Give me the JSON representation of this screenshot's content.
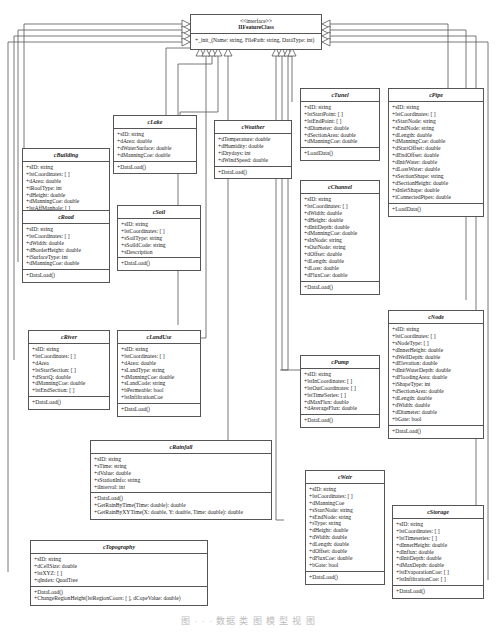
{
  "interface": {
    "stereotype": "<<interface>>",
    "name": "IIFeatureClass",
    "operation": "+_init_(Name: string, FilePath: string, DataType: int)"
  },
  "classes": {
    "building": {
      "name": "cBuilding",
      "attributes": [
        "+sID: string",
        "+lstCoordinates: [ ]",
        "+dArea: double",
        "+iRoofType: int",
        "+dHeight: double",
        "+dManningCoe: double",
        "+lstAffManhole: [ ]"
      ],
      "operations": [
        "+DataLoad()"
      ]
    },
    "lake": {
      "name": "cLake",
      "attributes": [
        "+sID: string",
        "+dArea: double",
        "+dWaterSurface: double",
        "+dManningCoe: double"
      ],
      "operations": [
        "+DataLoad()"
      ]
    },
    "weather": {
      "name": "cWeather",
      "attributes": [
        "+dTemperature: double",
        "+dHumidity: double",
        "+iDrydays: int",
        "+dWindSpeed: double"
      ],
      "operations": [
        "+DataLoad()"
      ]
    },
    "tunel": {
      "name": "cTunel",
      "attributes": [
        "+sID: string",
        "+lstStartPoint: [ ]",
        "+lstEndPoint: [ ]",
        "+dDiameter: double",
        "+dSectionArea: double",
        "+dManningCoe: double"
      ],
      "operations": [
        "+LoadData()"
      ]
    },
    "pipe": {
      "name": "cPipe",
      "attributes": [
        "+sID: string",
        "+lstCoordinates: [ ]",
        "+sStartNode: string",
        "+sEndNode: string",
        "+dLength: double",
        "+dManningCoe: double",
        "+dStartOffset: double",
        "+dEndOffset: double",
        "+dInitWater: double",
        "+dLossWater: double",
        "+sSectionShape: string",
        "+dSectionHeight: double",
        "+sInletShape: double",
        "+iConnectedPipes: double"
      ],
      "operations": [
        "+LoadData()"
      ]
    },
    "road": {
      "name": "cRoad",
      "attributes": [
        "+sID: string",
        "+lstCoordinates: [ ]",
        "+dWidth: double",
        "+dBorderHeight: double",
        "+iSurfaceType: int",
        "+dManningCoe: double"
      ],
      "operations": [
        "+DataLoad()"
      ]
    },
    "soil": {
      "name": "cSoil",
      "attributes": [
        "+sID: string",
        "+lstCoordinates: [ ]",
        "+sSoilType: string",
        "+sSoildCode: string",
        "+sDescription"
      ],
      "operations": [
        "+DataLoad()"
      ]
    },
    "channel": {
      "name": "cChannel",
      "attributes": [
        "+sID: string",
        "+lstCoordinates: [ ]",
        "+dWidth: double",
        "+dHeight: double",
        "+dInitDepth: double",
        "+dManningCoe: double",
        "+sInNode: string",
        "+sOutNode: string",
        "+dOffset: double",
        "+dLength: double",
        "+dLoss: double",
        "+dFluxCoe: double"
      ],
      "operations": [
        "+DataLoad()"
      ]
    },
    "river": {
      "name": "cRiver",
      "attributes": [
        "+sID: string",
        "+lstCoordinates: [ ]",
        "+dArea",
        "+lstStartSection: [ ]",
        "+dStartQ: double",
        "+dManningCoe: double",
        "+lstEndSection: [ ]"
      ],
      "operations": [
        "+DataLoad()"
      ]
    },
    "landuse": {
      "name": "cLandUse",
      "attributes": [
        "+sID: string",
        "+lstCoordinates: [ ]",
        "+dArea: double",
        "+sLandType: string",
        "+dManningCoe: double",
        "+sLandCode: string",
        "+bPermeable: bool",
        "+lstInfiltrationCoe"
      ],
      "operations": [
        "+DataLoad()"
      ]
    },
    "pump": {
      "name": "cPump",
      "attributes": [
        "+sID: string",
        "+lstInCoordinates: [ ]",
        "+lstOutCoordinates: [ ]",
        "+lstTimeSeries: [ ]",
        "+dMaxFlux: double",
        "+dAverageFlux: double"
      ],
      "operations": [
        "+DataLoad()"
      ]
    },
    "node": {
      "name": "cNode",
      "attributes": [
        "+sID: string",
        "+lstCoordinates: [ ]",
        "+sNodeType: [ ]",
        "+dInnerHeight: double",
        "+dWellDepth: double",
        "+dElevation: double",
        "+dInitWaterDepth: double",
        "+dFloodingArea: double",
        "+iShapeType: int",
        "+dSectionArea: double",
        "+dLength: double",
        "+dWidth: double",
        "+dDiameter: double",
        "+bGate: bool"
      ],
      "operations": [
        "+DataLoad()"
      ]
    },
    "rainfall": {
      "name": "cRainfall",
      "attributes": [
        "+sID: string",
        "+sTime: string",
        "+dValue: double",
        "+sStationInfo: string",
        "+iInterval: int"
      ],
      "operations": [
        "+DataLoad()",
        "+GetRainByTime(Time: double): double",
        "+GetRainByXYTime(X: double, Y: double, Time: double): double"
      ]
    },
    "weir": {
      "name": "cWeir",
      "attributes": [
        "+sID: string",
        "+lstCoordinates: [ ]",
        "+dManningCoe",
        "+sStartNode: string",
        "+sEndNode: string",
        "+sType: string",
        "+dHeight: double",
        "+dWidth: double",
        "+dLength: double",
        "+dOffset: double",
        "+dFluxCoe: double",
        "+bGate: bool"
      ],
      "operations": [
        "+DataLoad()"
      ]
    },
    "storage": {
      "name": "cStorage",
      "attributes": [
        "+sID: string",
        "+lstCoordinates: [ ]",
        "+lstTimeseries: [ ]",
        "+dInnerHeight: double",
        "+dInflux: double",
        "+dInitDepth: double",
        "+dMaxDepth: double",
        "+lstEvaporationCoe: [ ]",
        "+lstInfiltrationCoe: [ ]"
      ],
      "operations": [
        "+DataLoad()"
      ]
    },
    "topography": {
      "name": "cTopography",
      "attributes": [
        "+sID: string",
        "+dCellSize: double",
        "+lstXYZ: [ ]",
        "+qIndex: QuadTree"
      ],
      "operations": [
        "+DataLoad()",
        "+ChangeRegionHeight(lstRegionCoors: [ ], dCopeValue: double)"
      ]
    }
  },
  "caption": "图 · · · 数据 类 图 模 型 视 图"
}
